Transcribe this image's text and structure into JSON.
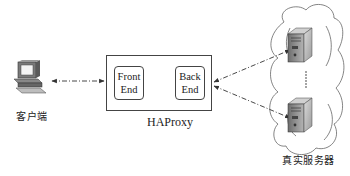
{
  "diagram": {
    "client": {
      "label": "客户端",
      "icon": "desktop-computer-icon"
    },
    "haproxy": {
      "label": "HAProxy",
      "frontend": {
        "line1": "Front",
        "line2": "End"
      },
      "backend": {
        "line1": "Back",
        "line2": "End"
      }
    },
    "servers": {
      "label": "真实服务器",
      "icon": "server-tower-icon",
      "ellipsis": "⋮",
      "count_visible": 2
    },
    "connections": [
      {
        "from": "client",
        "to": "frontend",
        "style": "dash-dot",
        "arrows": "both"
      },
      {
        "from": "backend",
        "to": "server-1",
        "style": "dash-dot",
        "arrows": "both"
      },
      {
        "from": "backend",
        "to": "server-2",
        "style": "dash-dot",
        "arrows": "both"
      }
    ],
    "colors": {
      "line": "#444444",
      "box_border": "#444444",
      "server_body": "#8a8a8a"
    }
  }
}
